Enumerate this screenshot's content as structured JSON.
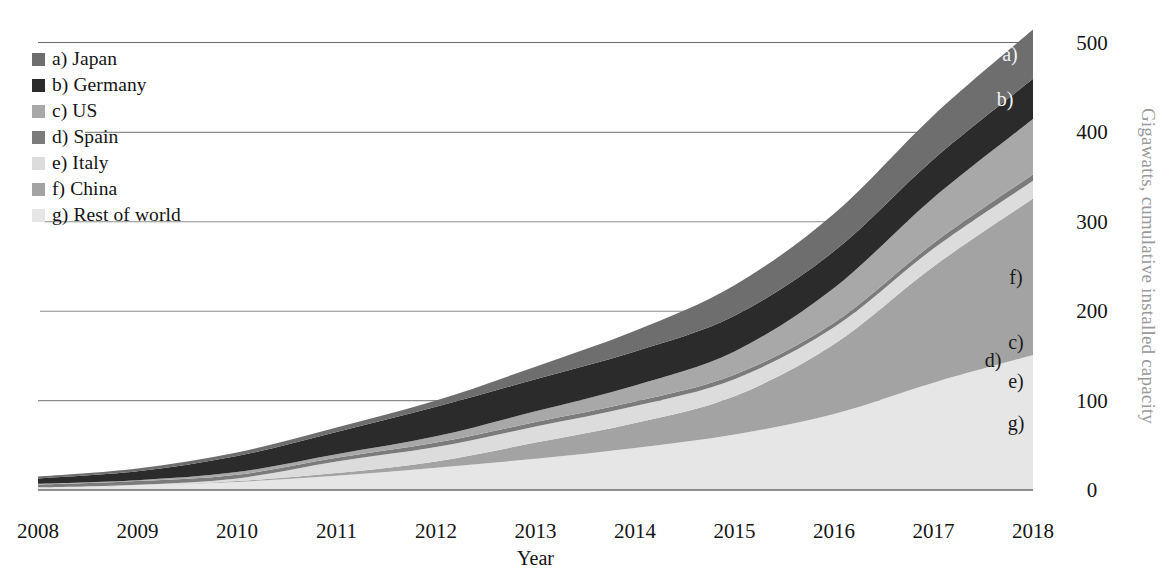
{
  "chart_data": {
    "type": "area",
    "stacked": true,
    "title": "",
    "subtitle": "",
    "xlabel": "Year",
    "ylabel": "Gigawatts, cumulative installed capacity",
    "ylabel_position": "right",
    "categories": [
      2008,
      2009,
      2010,
      2011,
      2012,
      2013,
      2014,
      2015,
      2016,
      2017,
      2018
    ],
    "x": [
      "2008",
      "2009",
      "2010",
      "2011",
      "2012",
      "2013",
      "2014",
      "2015",
      "2016",
      "2017",
      "2018"
    ],
    "xlim": [
      2008,
      2018
    ],
    "ylim": [
      0,
      515
    ],
    "yticks": [
      0,
      100,
      200,
      300,
      400,
      500
    ],
    "ytick_labels": [
      "0",
      "100",
      "200",
      "300",
      "400",
      "500"
    ],
    "grid": "horizontal",
    "legend_position": "top-left",
    "series": [
      {
        "key": "a",
        "name": "a) Japan",
        "color": "#6e6e6e",
        "values": [
          2,
          3,
          4,
          5,
          7,
          14,
          23,
          34,
          42,
          49,
          55
        ]
      },
      {
        "key": "b",
        "name": "b) Germany",
        "color": "#2b2b2b",
        "values": [
          6,
          10,
          18,
          25,
          33,
          36,
          38,
          40,
          41,
          43,
          45
        ]
      },
      {
        "key": "c",
        "name": "c) US",
        "color": "#a8a8a8",
        "values": [
          1,
          1,
          3,
          4,
          7,
          12,
          18,
          26,
          39,
          51,
          62
        ]
      },
      {
        "key": "d",
        "name": "d) Spain",
        "color": "#7b7b7b",
        "values": [
          3,
          4,
          4,
          4,
          5,
          5,
          5,
          5,
          5,
          6,
          7
        ]
      },
      {
        "key": "e",
        "name": "e) Italy",
        "color": "#dcdcdc",
        "values": [
          0,
          1,
          3,
          13,
          16,
          18,
          19,
          19,
          19,
          20,
          20
        ]
      },
      {
        "key": "f",
        "name": "f) China",
        "color": "#a3a3a3",
        "values": [
          0,
          0,
          1,
          3,
          7,
          18,
          28,
          43,
          78,
          130,
          175
        ]
      },
      {
        "key": "g",
        "name": "g) Rest of world",
        "color": "#e6e6e6",
        "values": [
          3,
          5,
          9,
          16,
          25,
          35,
          47,
          62,
          85,
          120,
          151
        ]
      }
    ],
    "totals": [
      15,
      24,
      42,
      70,
      100,
      138,
      178,
      229,
      309,
      419,
      515
    ],
    "annotations": [
      {
        "label": "a)",
        "series": "a"
      },
      {
        "label": "b)",
        "series": "b"
      },
      {
        "label": "c)",
        "series": "c"
      },
      {
        "label": "d)",
        "series": "d"
      },
      {
        "label": "e)",
        "series": "e"
      },
      {
        "label": "f)",
        "series": "f"
      },
      {
        "label": "g)",
        "series": "g"
      }
    ]
  },
  "legend": {
    "items": [
      {
        "label": "a) Japan",
        "color": "#6e6e6e"
      },
      {
        "label": "b) Germany",
        "color": "#2b2b2b"
      },
      {
        "label": "c) US",
        "color": "#a8a8a8"
      },
      {
        "label": "d) Spain",
        "color": "#7b7b7b"
      },
      {
        "label": "e) Italy",
        "color": "#dcdcdc"
      },
      {
        "label": "f) China",
        "color": "#a3a3a3"
      },
      {
        "label": "g) Rest of world",
        "color": "#e6e6e6"
      }
    ]
  },
  "axes": {
    "y_title": "Gigawatts, cumulative installed capacity",
    "x_title": "Year",
    "y_ticks": [
      "0",
      "100",
      "200",
      "300",
      "400",
      "500"
    ],
    "x_ticks": [
      "2008",
      "2009",
      "2010",
      "2011",
      "2012",
      "2013",
      "2014",
      "2015",
      "2016",
      "2017",
      "2018"
    ]
  },
  "tags": {
    "a": "a)",
    "b": "b)",
    "c": "c)",
    "d": "d)",
    "e": "e)",
    "f": "f)",
    "g": "g)"
  },
  "colors": {
    "gridline": "#8c8c8c",
    "axis_text": "#141414",
    "y_title": "#9a9a9a",
    "background": "#ffffff"
  }
}
